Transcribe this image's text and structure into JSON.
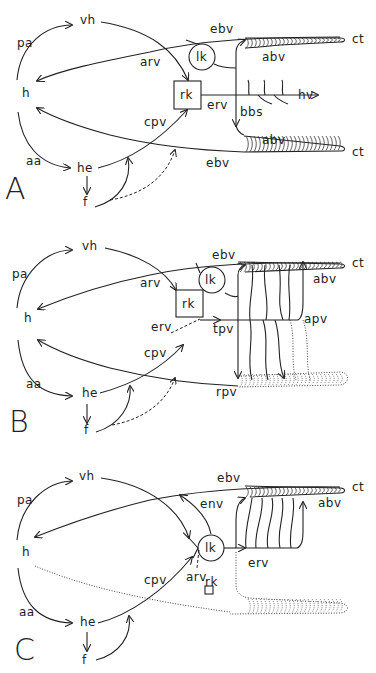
{
  "panels": [
    {
      "id": "A",
      "letter": "A",
      "labels": {
        "vh": "vh",
        "pa": "pa",
        "h": "h",
        "aa": "aa",
        "he": "he",
        "f": "f",
        "arv": "arv",
        "cpv": "cpv",
        "lk": "lk",
        "rk": "rk",
        "erv": "erv",
        "ebv_top": "ebv",
        "ebv_bottom": "ebv",
        "abv_top": "abv",
        "abv_bottom": "abv",
        "bbs": "bbs",
        "hv": "hv",
        "ct_top": "ct",
        "ct_bottom": "ct"
      }
    },
    {
      "id": "B",
      "letter": "B",
      "labels": {
        "vh": "vh",
        "pa": "pa",
        "h": "h",
        "aa": "aa",
        "he": "he",
        "f": "f",
        "arv": "arv",
        "cpv": "cpv",
        "lk": "lk",
        "rk": "rk",
        "erv": "erv",
        "ebv": "ebv",
        "abv": "abv",
        "apv": "apv",
        "tpv": "tpv",
        "rpv": "rpv",
        "ct": "ct"
      }
    },
    {
      "id": "C",
      "letter": "C",
      "labels": {
        "vh": "vh",
        "pa": "pa",
        "h": "h",
        "aa": "aa",
        "he": "he",
        "f": "f",
        "arv": "arv",
        "cpv": "cpv",
        "lk": "lk",
        "rk": "rk",
        "erv": "erv",
        "env": "env",
        "ebv": "ebv",
        "abv": "abv",
        "ct": "ct"
      }
    }
  ],
  "colors": {
    "ink": "#222222",
    "background": "#ffffff"
  }
}
